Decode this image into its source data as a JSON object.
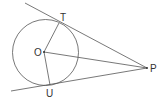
{
  "diagram": {
    "labels": {
      "T": "T",
      "O": "O",
      "P": "P",
      "U": "U"
    },
    "points": {
      "O": [
        45,
        52
      ],
      "T": [
        59,
        23
      ],
      "U": [
        50,
        85
      ],
      "P": [
        147,
        68
      ]
    },
    "circle": {
      "cx": 45.5,
      "cy": 52.5,
      "r": 33
    },
    "stroke_color": "#444444"
  }
}
